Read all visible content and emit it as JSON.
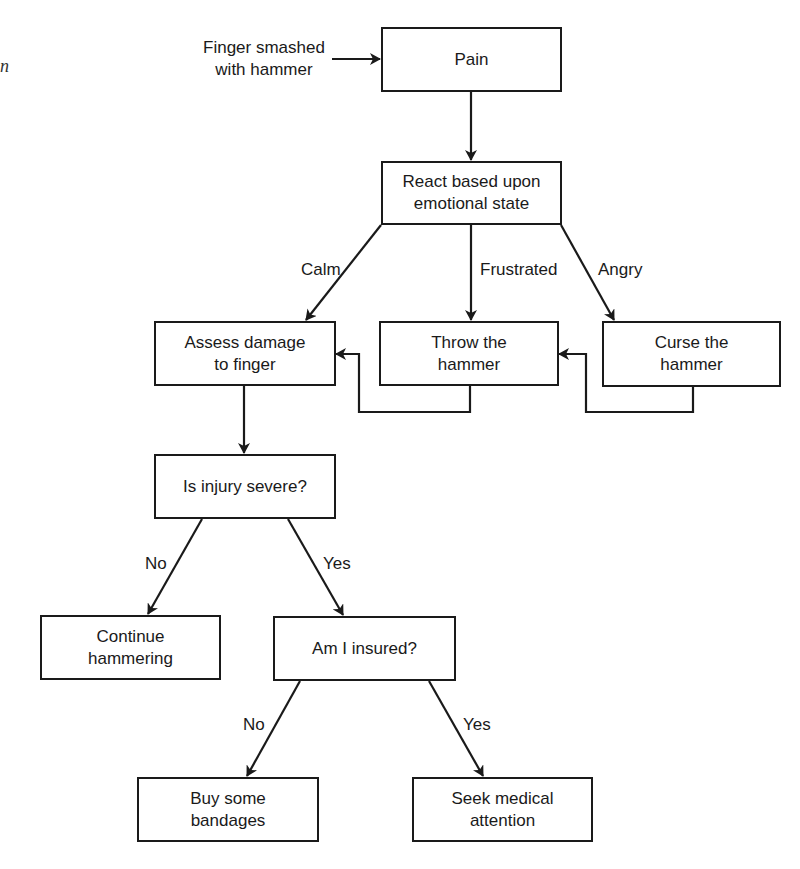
{
  "diagram": {
    "type": "flowchart",
    "edge_fragment": "n",
    "input": {
      "line1": "Finger smashed",
      "line2": "with hammer"
    },
    "nodes": {
      "pain": {
        "label": "Pain"
      },
      "react": {
        "line1": "React based upon",
        "line2": "emotional state"
      },
      "assess": {
        "line1": "Assess damage",
        "line2": "to finger"
      },
      "throw": {
        "line1": "Throw the",
        "line2": "hammer"
      },
      "curse": {
        "line1": "Curse the",
        "line2": "hammer"
      },
      "severe": {
        "label": "Is injury severe?"
      },
      "continue": {
        "line1": "Continue",
        "line2": "hammering"
      },
      "insured": {
        "label": "Am I insured?"
      },
      "bandages": {
        "line1": "Buy some",
        "line2": "bandages"
      },
      "medical": {
        "line1": "Seek medical",
        "line2": "attention"
      }
    },
    "edge_labels": {
      "calm": "Calm",
      "frustrated": "Frustrated",
      "angry": "Angry",
      "severe_no": "No",
      "severe_yes": "Yes",
      "insured_no": "No",
      "insured_yes": "Yes"
    },
    "edges": [
      {
        "from": "input",
        "to": "pain"
      },
      {
        "from": "pain",
        "to": "react"
      },
      {
        "from": "react",
        "to": "assess",
        "label": "Calm"
      },
      {
        "from": "react",
        "to": "throw",
        "label": "Frustrated"
      },
      {
        "from": "react",
        "to": "curse",
        "label": "Angry"
      },
      {
        "from": "throw",
        "to": "assess"
      },
      {
        "from": "curse",
        "to": "throw"
      },
      {
        "from": "assess",
        "to": "severe"
      },
      {
        "from": "severe",
        "to": "continue",
        "label": "No"
      },
      {
        "from": "severe",
        "to": "insured",
        "label": "Yes"
      },
      {
        "from": "insured",
        "to": "bandages",
        "label": "No"
      },
      {
        "from": "insured",
        "to": "medical",
        "label": "Yes"
      }
    ]
  }
}
